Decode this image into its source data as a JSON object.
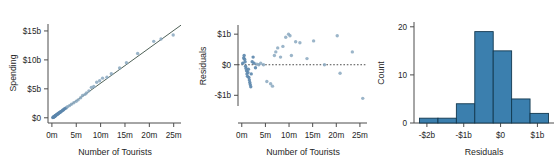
{
  "figure": {
    "panel_count": 3,
    "background_color": "#ffffff",
    "point_color": "#8aa8c0",
    "line_color": "#4f6157",
    "bar_fill_color": "#3b7fae",
    "bar_edge_color": "#12384f",
    "axis_color": "#4d4d4d"
  },
  "chart_data": [
    {
      "type": "scatter",
      "name": "spending-vs-tourists",
      "title": "",
      "xlabel": "Number of Tourists",
      "ylabel": "Spending",
      "xticklabels": [
        "0m",
        "5m",
        "10m",
        "15m",
        "20m",
        "25m"
      ],
      "xtickvalues": [
        0,
        5,
        10,
        15,
        20,
        25
      ],
      "yticklabels": [
        "$0",
        "$5b",
        "$10b",
        "$15b"
      ],
      "ytickvalues": [
        0,
        5,
        10,
        15
      ],
      "xlim": [
        -0.8,
        26.5
      ],
      "ylim": [
        -0.9,
        16.2
      ],
      "grid": false,
      "legend": "none",
      "trendline": {
        "type": "linear",
        "x": [
          0,
          26.5
        ],
        "y": [
          -0.1,
          16.0
        ]
      },
      "x": [
        0.2,
        0.3,
        0.35,
        0.4,
        0.5,
        0.55,
        0.6,
        0.7,
        0.75,
        0.8,
        0.9,
        1.0,
        1.1,
        1.2,
        1.3,
        1.4,
        1.5,
        1.7,
        1.8,
        2.0,
        2.2,
        2.4,
        2.6,
        2.9,
        3.2,
        3.6,
        4.0,
        4.5,
        5.0,
        5.4,
        5.9,
        6.3,
        6.8,
        7.1,
        7.6,
        8.1,
        8.6,
        9.2,
        9.8,
        10.4,
        11.3,
        12.2,
        13.9,
        15.3,
        17.6,
        20.9,
        22.4,
        24.9
      ],
      "y": [
        0.05,
        0.1,
        0.12,
        0.18,
        0.2,
        0.25,
        0.3,
        0.32,
        0.38,
        0.42,
        0.5,
        0.55,
        0.6,
        0.65,
        0.72,
        0.8,
        0.88,
        0.95,
        1.05,
        1.15,
        1.3,
        1.4,
        1.55,
        1.7,
        1.9,
        2.1,
        2.35,
        2.6,
        2.85,
        3.1,
        3.45,
        3.85,
        4.05,
        4.3,
        4.65,
        5.25,
        5.4,
        6.15,
        6.4,
        6.85,
        7.0,
        7.6,
        8.6,
        9.5,
        11.1,
        13.2,
        13.6,
        14.3
      ]
    },
    {
      "type": "scatter",
      "name": "residuals-vs-tourists",
      "title": "",
      "xlabel": "Number of Tourists",
      "ylabel": "Residuals",
      "xticklabels": [
        "0m",
        "5m",
        "10m",
        "15m",
        "20m",
        "25m"
      ],
      "xtickvalues": [
        0,
        5,
        10,
        15,
        20,
        25
      ],
      "yticklabels": [
        "-$1b",
        "$0",
        "$1b"
      ],
      "ytickvalues": [
        -1,
        0,
        1
      ],
      "xlim": [
        -0.8,
        26.5
      ],
      "ylim": [
        -1.35,
        1.3
      ],
      "grid": false,
      "legend": "none",
      "reference_line": {
        "type": "horizontal",
        "y": 0,
        "style": "dotted"
      },
      "x": [
        0.2,
        0.4,
        0.5,
        0.6,
        0.7,
        0.8,
        0.9,
        1.0,
        1.1,
        1.2,
        1.3,
        1.4,
        1.5,
        1.6,
        1.7,
        1.8,
        1.9,
        2.0,
        2.2,
        2.4,
        2.6,
        2.9,
        3.2,
        3.6,
        4.0,
        4.6,
        5.3,
        6.1,
        6.5,
        6.9,
        7.2,
        7.6,
        8.2,
        8.7,
        9.3,
        9.9,
        10.2,
        10.5,
        11.4,
        12.3,
        13.8,
        15.2,
        17.5,
        20.2,
        20.8,
        23.4,
        25.6
      ],
      "y": [
        0.05,
        0.22,
        0.3,
        0.18,
        0.1,
        -0.05,
        -0.12,
        -0.2,
        -0.3,
        -0.38,
        -0.25,
        -0.15,
        -0.42,
        -0.5,
        -0.58,
        -0.65,
        -0.72,
        -0.3,
        0.1,
        0.25,
        0.05,
        -0.1,
        0.02,
        0.0,
        0.05,
        0.0,
        -0.55,
        -0.62,
        -0.7,
        0.3,
        0.42,
        0.55,
        0.25,
        0.6,
        0.9,
        1.0,
        0.95,
        0.3,
        0.75,
        0.72,
        0.2,
        0.78,
        0.0,
        0.95,
        -0.28,
        0.42,
        -1.1
      ]
    },
    {
      "type": "bar",
      "name": "residuals-histogram",
      "title": "",
      "xlabel": "Residuals",
      "ylabel": "Count",
      "xticklabels": [
        "-$2b",
        "-$1b",
        "$0",
        "$1b"
      ],
      "xtickvalues": [
        -2,
        -1,
        0,
        1
      ],
      "yticklabels": [
        "0",
        "10",
        "20"
      ],
      "ytickvalues": [
        0,
        10,
        20
      ],
      "xlim": [
        -2.35,
        1.45
      ],
      "ylim": [
        0,
        21
      ],
      "grid": false,
      "legend": "none",
      "bin_edges": [
        -2.2,
        -1.7,
        -1.2,
        -0.7,
        -0.2,
        0.3,
        0.8,
        1.3
      ],
      "bin_centers": [
        -1.95,
        -1.45,
        -0.95,
        -0.45,
        0.05,
        0.55,
        1.05
      ],
      "values": [
        1,
        1,
        4,
        19,
        15,
        5,
        2
      ]
    }
  ]
}
